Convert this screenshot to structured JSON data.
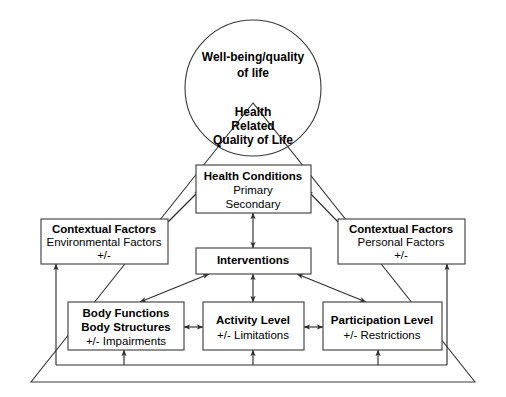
{
  "diagram": {
    "colors": {
      "stroke": "#3a3a3a",
      "box_stroke": "#4a4a4a",
      "connector": "#2e2e2e",
      "background": "#ffffff",
      "text": "#000000"
    },
    "circle": {
      "line1": "Well-being/quality",
      "line2": "of life",
      "inner_line1": "Health",
      "inner_line2": "Related",
      "inner_line3": "Quality of Life"
    },
    "boxes": {
      "health_conditions": {
        "title": "Health Conditions",
        "line2": "Primary",
        "line3": "Secondary"
      },
      "contextual_environmental": {
        "title": "Contextual Factors",
        "line2": "Environmental Factors",
        "line3": "+/-"
      },
      "contextual_personal": {
        "title": "Contextual Factors",
        "line2": "Personal Factors",
        "line3": "+/-"
      },
      "interventions": {
        "title": "Interventions"
      },
      "body_functions": {
        "title_line1": "Body Functions",
        "title_line2": "Body Structures",
        "line3": "+/- Impairments"
      },
      "activity_level": {
        "title": "Activity Level",
        "line2": "+/- Limitations"
      },
      "participation_level": {
        "title": "Participation Level",
        "line2": "+/- Restrictions"
      }
    }
  }
}
